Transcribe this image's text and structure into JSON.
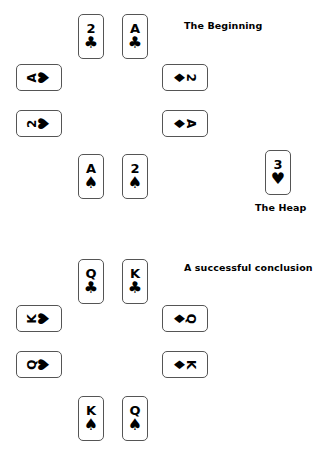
{
  "page": {
    "title": "Playing card puzzle diagram",
    "background_color": "#ffffff",
    "ink_color": "#000000",
    "card_border_color": "#555555"
  },
  "diagrams": [
    {
      "id": "beginning",
      "caption": "The Beginning",
      "cards": [
        {
          "id": "top-left",
          "rank": "2",
          "suit": "clubs",
          "glyph": "♣",
          "orientation": "upright",
          "x": 78,
          "y": 14
        },
        {
          "id": "top-right",
          "rank": "A",
          "suit": "clubs",
          "glyph": "♣",
          "orientation": "upright",
          "x": 122,
          "y": 14
        },
        {
          "id": "left-upper",
          "rank": "A",
          "suit": "hearts",
          "glyph": "♥",
          "orientation": "rotated-ccw",
          "x": 16,
          "y": 64
        },
        {
          "id": "left-lower",
          "rank": "2",
          "suit": "hearts",
          "glyph": "♥",
          "orientation": "rotated-ccw",
          "x": 16,
          "y": 110
        },
        {
          "id": "right-upper",
          "rank": "2",
          "suit": "diamonds",
          "glyph": "♦",
          "orientation": "rotated-cw",
          "x": 162,
          "y": 64
        },
        {
          "id": "right-lower",
          "rank": "A",
          "suit": "diamonds",
          "glyph": "♦",
          "orientation": "rotated-cw",
          "x": 162,
          "y": 110
        },
        {
          "id": "bottom-left",
          "rank": "A",
          "suit": "spades",
          "glyph": "♠",
          "orientation": "upright",
          "x": 78,
          "y": 154
        },
        {
          "id": "bottom-right",
          "rank": "2",
          "suit": "spades",
          "glyph": "♠",
          "orientation": "upright",
          "x": 122,
          "y": 154
        }
      ],
      "caption_pos": {
        "x": 184,
        "y": 20
      }
    },
    {
      "id": "conclusion",
      "caption": "A successful conclusion",
      "cards": [
        {
          "id": "top-left",
          "rank": "Q",
          "suit": "clubs",
          "glyph": "♣",
          "orientation": "upright",
          "x": 78,
          "y": 259
        },
        {
          "id": "top-right",
          "rank": "K",
          "suit": "clubs",
          "glyph": "♣",
          "orientation": "upright",
          "x": 122,
          "y": 259
        },
        {
          "id": "left-upper",
          "rank": "K",
          "suit": "hearts",
          "glyph": "♥",
          "orientation": "rotated-ccw",
          "x": 16,
          "y": 305
        },
        {
          "id": "left-lower",
          "rank": "Q",
          "suit": "hearts",
          "glyph": "♥",
          "orientation": "rotated-ccw",
          "x": 16,
          "y": 351
        },
        {
          "id": "right-upper",
          "rank": "Q",
          "suit": "diamonds",
          "glyph": "♦",
          "orientation": "rotated-cw",
          "x": 162,
          "y": 305
        },
        {
          "id": "right-lower",
          "rank": "K",
          "suit": "diamonds",
          "glyph": "♦",
          "orientation": "rotated-cw",
          "x": 162,
          "y": 351
        },
        {
          "id": "bottom-left",
          "rank": "K",
          "suit": "spades",
          "glyph": "♠",
          "orientation": "upright",
          "x": 78,
          "y": 396
        },
        {
          "id": "bottom-right",
          "rank": "Q",
          "suit": "spades",
          "glyph": "♠",
          "orientation": "upright",
          "x": 122,
          "y": 396
        }
      ],
      "caption_pos": {
        "x": 184,
        "y": 262
      }
    }
  ],
  "heap": {
    "caption": "The Heap",
    "card": {
      "id": "heap-card",
      "rank": "3",
      "suit": "hearts",
      "glyph": "♥",
      "orientation": "upright",
      "x": 265,
      "y": 150
    },
    "caption_pos": {
      "x": 255,
      "y": 202
    }
  }
}
